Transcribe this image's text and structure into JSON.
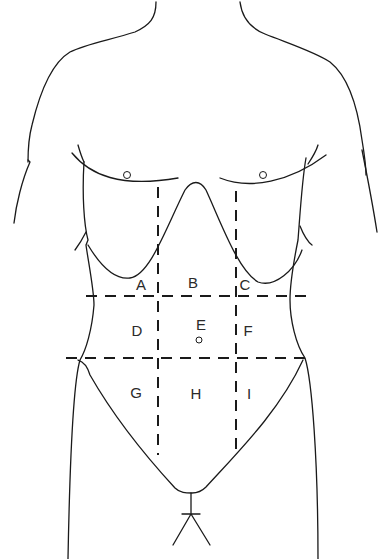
{
  "diagram": {
    "stroke_color": "#1a1a1a",
    "background": "#ffffff",
    "regions": [
      {
        "id": "A",
        "label": "A",
        "x": 141,
        "y": 284
      },
      {
        "id": "B",
        "label": "B",
        "x": 193,
        "y": 282
      },
      {
        "id": "C",
        "label": "C",
        "x": 245,
        "y": 284
      },
      {
        "id": "D",
        "label": "D",
        "x": 137,
        "y": 330
      },
      {
        "id": "E",
        "label": "E",
        "x": 201,
        "y": 324
      },
      {
        "id": "F",
        "label": "F",
        "x": 248,
        "y": 330
      },
      {
        "id": "G",
        "label": "G",
        "x": 136,
        "y": 392
      },
      {
        "id": "H",
        "label": "H",
        "x": 196,
        "y": 393
      },
      {
        "id": "I",
        "label": "I",
        "x": 249,
        "y": 393
      }
    ],
    "landmarks": [
      "left-nipple",
      "right-nipple",
      "umbilicus"
    ]
  }
}
